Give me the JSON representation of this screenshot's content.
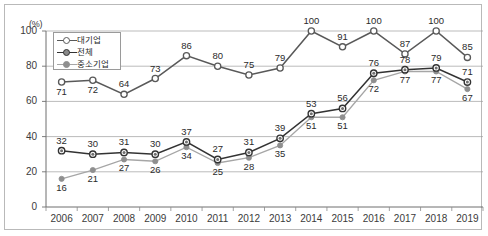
{
  "chart_data": {
    "type": "line",
    "title": "",
    "xlabel": "",
    "ylabel": "(%)",
    "unit_label": "(%)",
    "categories": [
      "2006",
      "2007",
      "2008",
      "2009",
      "2010",
      "2011",
      "2012",
      "2013",
      "2014",
      "2015",
      "2016",
      "2017",
      "2018",
      "2019"
    ],
    "ylim": [
      0,
      100
    ],
    "yticks": [
      0,
      20,
      40,
      60,
      80,
      100
    ],
    "grid": true,
    "legend_position": "top-left",
    "series": [
      {
        "name": "대기업",
        "marker": "open-circle",
        "color": "#595959",
        "values": [
          71,
          72,
          64,
          73,
          86,
          80,
          75,
          79,
          100,
          91,
          100,
          87,
          100,
          85
        ]
      },
      {
        "name": "전체",
        "marker": "dot-circle",
        "color": "#333333",
        "values": [
          32,
          30,
          31,
          30,
          37,
          27,
          31,
          39,
          53,
          56,
          76,
          78,
          79,
          71
        ]
      },
      {
        "name": "중소기업",
        "marker": "filled-circle",
        "color": "#a6a6a6",
        "values": [
          16,
          21,
          27,
          26,
          34,
          25,
          28,
          35,
          51,
          51,
          72,
          77,
          77,
          67
        ]
      }
    ]
  }
}
